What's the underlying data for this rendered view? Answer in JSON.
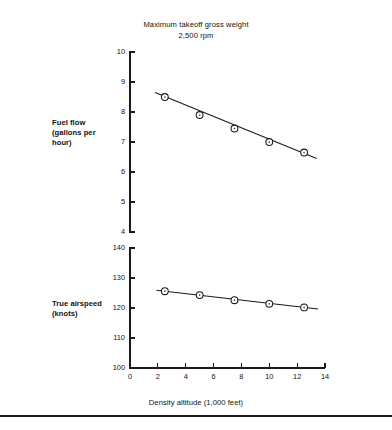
{
  "title": {
    "line1": "Maximum takeoff gross weight",
    "line2": "2,500 rpm"
  },
  "captions": {
    "fuel_flow": "Fuel flow (gallons per hour)",
    "true_airspeed": "True airspeed (knots)",
    "x_axis": "Density altitude (1,000 feet)"
  },
  "colors": {
    "ink": "#1a1a1a",
    "paper": "#ffffff",
    "marker_fill": "#ffffff"
  },
  "chart_data": [
    {
      "type": "line",
      "id": "fuel-flow",
      "title": "Maximum takeoff gross weight 2,500 rpm",
      "xlabel": "Density altitude (1,000 feet)",
      "ylabel": "Fuel flow (gallons per hour)",
      "xlim": [
        0,
        14
      ],
      "ylim": [
        4,
        10
      ],
      "xticks": [
        0,
        2,
        4,
        6,
        8,
        10,
        12,
        14
      ],
      "xticklabels": [
        "",
        "",
        "",
        "",
        "",
        "",
        "",
        ""
      ],
      "yticks": [
        4,
        5,
        6,
        7,
        8,
        9,
        10
      ],
      "yticklabels": [
        "4",
        "5",
        "6",
        "7",
        "8",
        "9",
        "10"
      ],
      "grid": false,
      "legend": "none",
      "x": [
        2.5,
        5.0,
        7.5,
        10.0,
        12.5
      ],
      "values": [
        8.5,
        7.9,
        7.45,
        7.0,
        6.65
      ],
      "fit_line": {
        "x": [
          1.8,
          13.4
        ],
        "y": [
          8.65,
          6.45
        ]
      },
      "marker": "circle"
    },
    {
      "type": "line",
      "id": "true-airspeed",
      "title": "",
      "xlabel": "Density altitude (1,000 feet)",
      "ylabel": "True airspeed (knots)",
      "xlim": [
        0,
        14
      ],
      "ylim": [
        100,
        140
      ],
      "xticks": [
        0,
        2,
        4,
        6,
        8,
        10,
        12,
        14
      ],
      "xticklabels": [
        "0",
        "2",
        "4",
        "6",
        "8",
        "10",
        "12",
        "14"
      ],
      "yticks": [
        100,
        110,
        120,
        130,
        140
      ],
      "yticklabels": [
        "100",
        "110",
        "120",
        "130",
        "140"
      ],
      "grid": false,
      "legend": "none",
      "x": [
        2.5,
        5.0,
        7.5,
        10.0,
        12.5
      ],
      "values": [
        125.6,
        124.3,
        122.6,
        121.4,
        120.2
      ],
      "fit_line": {
        "x": [
          1.9,
          13.5
        ],
        "y": [
          125.9,
          119.7
        ]
      },
      "marker": "circle"
    }
  ]
}
